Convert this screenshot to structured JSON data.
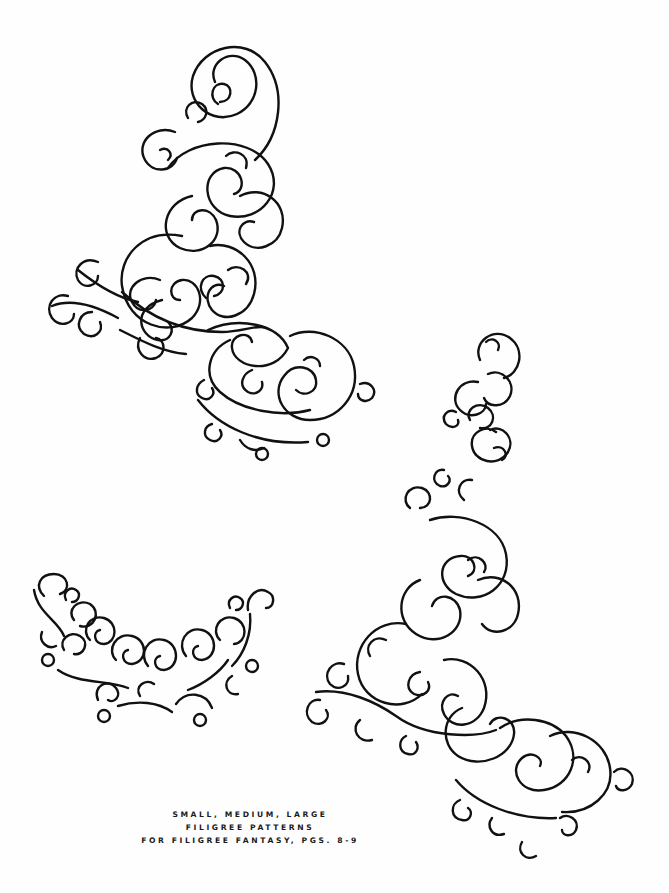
{
  "page": {
    "background": "#fefefe",
    "ink_color": "#111111"
  },
  "patterns": [
    {
      "name": "Large filigree corner (top)",
      "size": "large"
    },
    {
      "name": "Small filigree crescent",
      "size": "small"
    },
    {
      "name": "Medium filigree corner (right)",
      "size": "medium"
    }
  ],
  "caption": {
    "line1": "SMALL, MEDIUM, LARGE",
    "line2": "FILIGREE PATTERNS",
    "line3": "FOR FILIGREE FANTASY, PGS. 8-9"
  }
}
